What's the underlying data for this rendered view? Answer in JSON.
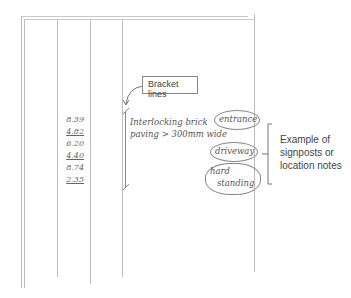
{
  "diagram": {
    "callout_label": "Bracket lines",
    "levels": [
      {
        "value": "8.39",
        "underlined": false
      },
      {
        "value": "4.82",
        "underlined": true
      },
      {
        "value": "6.20",
        "underlined": false
      },
      {
        "value": "4.40",
        "underlined": true
      },
      {
        "value": "8.74",
        "underlined": false
      },
      {
        "value": "2.35",
        "underlined": true
      }
    ],
    "description_line1": "Interlocking brick",
    "description_line2": "paving > 300mm wide",
    "location_notes": [
      "entrance",
      "driveway",
      "hard",
      "standing"
    ],
    "side_note": [
      "Example of",
      "signposts or",
      "location notes"
    ]
  }
}
